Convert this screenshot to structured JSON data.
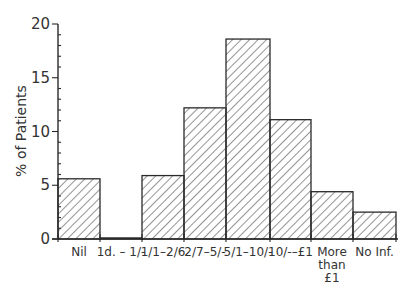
{
  "chart_data": {
    "type": "bar",
    "title": "",
    "xlabel": "",
    "ylabel": "% of Patients",
    "ylim": [
      0,
      20
    ],
    "yticks": [
      0,
      5,
      10,
      15,
      20
    ],
    "grid": false,
    "legend": null,
    "style": "histogram with diagonal hatching, no gaps between bars",
    "categories": [
      "Nil",
      "1d. – 1/-",
      "1/1–2/6",
      "2/7–5/-",
      "5/1–10/-",
      "10/-–£1",
      "More than £1",
      "No Inf."
    ],
    "category_label_lines": [
      [
        "Nil"
      ],
      [
        "1d. – 1/-"
      ],
      [
        "1/1–2/6"
      ],
      [
        "2/7–5/-"
      ],
      [
        "5/1–10/-"
      ],
      [
        "10/-–£1"
      ],
      [
        "More",
        "than",
        "£1"
      ],
      [
        "No Inf."
      ]
    ],
    "values": [
      5.6,
      0.1,
      5.9,
      12.2,
      18.6,
      11.1,
      4.4,
      2.5
    ]
  },
  "colors": {
    "stroke": "#2a2a2a",
    "hatch": "#3a3a3a",
    "text": "#333333",
    "background": "#ffffff"
  }
}
